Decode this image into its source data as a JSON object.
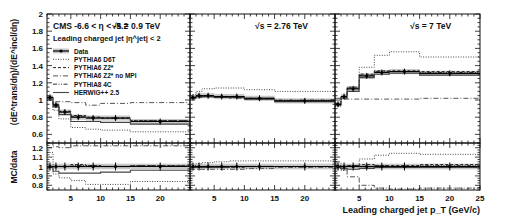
{
  "chart_data": {
    "type": "line",
    "title": "CMS  -6.6 < η < -5.2",
    "selection": "Leading charged jet |η^jet| < 2",
    "xlabel": "Leading charged jet p_T (GeV/c)",
    "ylabel_main": "(dE^trans/dη)/(dE^incl/dη)",
    "ylabel_ratio": "MC/data",
    "xlim": [
      1,
      25
    ],
    "ylim_main": [
      0.5,
      2.0
    ],
    "ylim_ratio": [
      0.75,
      1.25
    ],
    "xticks": [
      5,
      10,
      15,
      20,
      25
    ],
    "yticks_main": [
      0.6,
      0.8,
      1,
      1.2,
      1.4,
      1.6,
      1.8,
      2
    ],
    "yticks_ratio": [
      0.8,
      0.9,
      1,
      1.1,
      1.2
    ],
    "bin_edges": [
      1,
      2,
      3,
      5,
      7.5,
      10,
      15,
      25
    ],
    "legend": [
      {
        "name": "Data",
        "style": "marker"
      },
      {
        "name": "PYTHIA6 D6T",
        "style": "dotted"
      },
      {
        "name": "PYTHIA6 Z2*",
        "style": "dashed"
      },
      {
        "name": "PYTHIA6 Z2* no MPI",
        "style": "dashdot"
      },
      {
        "name": "PYTHIA8 4C",
        "style": "dashdotdot"
      },
      {
        "name": "HERWIG++ 2.5",
        "style": "solid"
      }
    ],
    "panels": [
      {
        "energy_label": "√s = 0.9 TeV",
        "data": [
          1.03,
          0.94,
          0.86,
          0.8,
          0.79,
          0.79,
          0.75
        ],
        "band": 0.03,
        "series": [
          {
            "name": "PYTHIA6 D6T",
            "values": [
              1.0,
              0.88,
              0.78,
              0.68,
              0.66,
              0.65,
              0.63
            ]
          },
          {
            "name": "PYTHIA6 Z2*",
            "values": [
              1.03,
              0.95,
              0.87,
              0.82,
              0.8,
              0.79,
              0.76
            ]
          },
          {
            "name": "PYTHIA6 Z2* no MPI",
            "values": [
              1.0,
              0.98,
              0.98,
              0.97,
              0.94,
              0.96,
              0.97
            ]
          },
          {
            "name": "PYTHIA8 4C",
            "values": [
              1.03,
              0.95,
              0.86,
              0.81,
              0.8,
              0.79,
              0.76
            ]
          },
          {
            "name": "HERWIG++ 2.5",
            "values": [
              1.02,
              0.92,
              0.83,
              0.75,
              0.75,
              0.74,
              0.72
            ]
          }
        ],
        "ratio": {
          "data": [
            1,
            1,
            1,
            1,
            1,
            1,
            1
          ],
          "series": [
            {
              "name": "PYTHIA6 D6T",
              "values": [
                1.15,
                0.92,
                0.88,
                0.85,
                0.81,
                0.81,
                0.84
              ]
            },
            {
              "name": "PYTHIA6 Z2*",
              "values": [
                1.0,
                1.0,
                1.0,
                1.02,
                1.01,
                1.0,
                1.01
              ]
            },
            {
              "name": "PYTHIA6 Z2* no MPI",
              "values": [
                1.2,
                1.21,
                1.2,
                1.22,
                1.22,
                1.22,
                1.22
              ]
            },
            {
              "name": "PYTHIA8 4C",
              "values": [
                1.0,
                1.0,
                1.0,
                1.01,
                1.01,
                1.0,
                1.01
              ]
            },
            {
              "name": "HERWIG++ 2.5",
              "values": [
                0.99,
                0.95,
                0.93,
                0.93,
                0.93,
                0.94,
                0.96
              ]
            }
          ]
        }
      },
      {
        "energy_label": "√s = 2.76 TeV",
        "data": [
          1.03,
          1.05,
          1.05,
          1.04,
          1.04,
          1.02,
          0.99
        ],
        "band": 0.03,
        "series": [
          {
            "name": "PYTHIA6 D6T",
            "values": [
              1.06,
              1.1,
              1.13,
              1.14,
              1.14,
              1.12,
              1.1
            ]
          },
          {
            "name": "PYTHIA6 Z2*",
            "values": [
              1.03,
              1.05,
              1.04,
              1.04,
              1.04,
              1.01,
              0.99
            ]
          },
          {
            "name": "PYTHIA6 Z2* no MPI",
            "values": [
              1.02,
              1.03,
              1.04,
              1.03,
              1.02,
              1.01,
              0.99
            ]
          },
          {
            "name": "PYTHIA8 4C",
            "values": [
              1.03,
              1.05,
              1.05,
              1.04,
              1.04,
              1.02,
              1.0
            ]
          },
          {
            "name": "HERWIG++ 2.5",
            "values": [
              1.02,
              1.04,
              1.04,
              1.03,
              1.03,
              1.01,
              0.98
            ]
          }
        ],
        "ratio": {
          "data": [
            1,
            1,
            1,
            1,
            1,
            1,
            1
          ],
          "series": [
            {
              "name": "PYTHIA6 D6T",
              "values": [
                1.01,
                1.03,
                1.04,
                1.05,
                1.06,
                1.06,
                1.06
              ]
            },
            {
              "name": "PYTHIA6 Z2*",
              "values": [
                1.0,
                1.0,
                1.0,
                1.0,
                1.0,
                1.0,
                1.0
              ]
            },
            {
              "name": "PYTHIA6 Z2* no MPI",
              "values": [
                0.97,
                0.97,
                0.97,
                0.97,
                0.97,
                0.98,
                0.99
              ]
            },
            {
              "name": "PYTHIA8 4C",
              "values": [
                1.0,
                0.99,
                0.99,
                0.99,
                0.99,
                1.0,
                1.0
              ]
            },
            {
              "name": "HERWIG++ 2.5",
              "values": [
                0.99,
                0.99,
                0.99,
                0.99,
                1.0,
                1.0,
                1.0
              ]
            }
          ]
        }
      },
      {
        "energy_label": "√s = 7 TeV",
        "data": [
          0.95,
          1.04,
          1.13,
          1.28,
          1.32,
          1.33,
          1.31
        ],
        "band": 0.03,
        "series": [
          {
            "name": "PYTHIA6 D6T",
            "values": [
              0.93,
              1.02,
              1.14,
              1.38,
              1.52,
              1.56,
              1.5
            ]
          },
          {
            "name": "PYTHIA6 Z2*",
            "values": [
              0.96,
              1.04,
              1.15,
              1.3,
              1.34,
              1.34,
              1.33
            ]
          },
          {
            "name": "PYTHIA6 Z2* no MPI",
            "values": [
              1.02,
              1.01,
              1.01,
              1.01,
              1.01,
              1.01,
              1.02
            ]
          },
          {
            "name": "PYTHIA8 4C",
            "values": [
              0.95,
              1.04,
              1.14,
              1.29,
              1.33,
              1.33,
              1.32
            ]
          },
          {
            "name": "HERWIG++ 2.5",
            "values": [
              0.94,
              1.02,
              1.1,
              1.26,
              1.3,
              1.31,
              1.29
            ]
          }
        ],
        "ratio": {
          "data": [
            1,
            1,
            1,
            1,
            1,
            1,
            1
          ],
          "series": [
            {
              "name": "PYTHIA6 D6T",
              "values": [
                0.98,
                0.96,
                1.0,
                1.08,
                1.12,
                1.14,
                1.13
              ]
            },
            {
              "name": "PYTHIA6 Z2*",
              "values": [
                1.01,
                1.0,
                1.01,
                1.02,
                1.01,
                1.01,
                1.02
              ]
            },
            {
              "name": "PYTHIA6 Z2* no MPI",
              "values": [
                1.05,
                0.97,
                0.89,
                0.8,
                0.77,
                0.76,
                0.77
              ]
            },
            {
              "name": "PYTHIA8 4C",
              "values": [
                1.0,
                1.0,
                1.01,
                1.0,
                1.01,
                1.0,
                1.01
              ]
            },
            {
              "name": "HERWIG++ 2.5",
              "values": [
                0.99,
                0.98,
                0.97,
                0.98,
                0.99,
                0.99,
                0.99
              ]
            }
          ]
        }
      }
    ]
  }
}
